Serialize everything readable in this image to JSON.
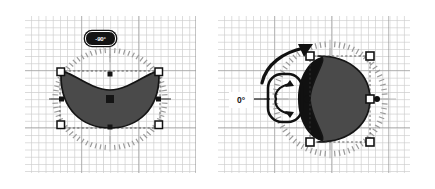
{
  "app": {
    "title": "Shape Rotation Tool",
    "view": "two-panel-comparison"
  },
  "panels": [
    {
      "id": "left",
      "name": "rotation-before-panel",
      "caption": "",
      "angle_label": "-90°",
      "angle_value": -90,
      "shape": {
        "name": "crescent-moon",
        "fill": "#4a4a4a",
        "stroke": "#141414",
        "orientation": "horizontal-concave-up"
      },
      "dial": {
        "visible": true,
        "tick_count": 72,
        "tick_color": "#9a9a9a",
        "cardinal_tick_color": "#b4b4b4"
      },
      "handles": {
        "corner_count": 4,
        "edge_count": 4,
        "center": 1,
        "corner_fill": "#ffffff",
        "corner_stroke": "#111111",
        "edge_fill": "#111111"
      },
      "rotation_arrow": {
        "visible": false
      },
      "rotation_cursor": {
        "visible": false
      }
    },
    {
      "id": "right",
      "name": "rotation-after-panel",
      "caption": "",
      "angle_label": "0°",
      "angle_value": 0,
      "shape": {
        "name": "crescent-moon",
        "fill": "#4a4a4a",
        "stroke": "#141414",
        "orientation": "vertical-concave-left"
      },
      "ghost": {
        "visible": true,
        "name": "rotation-ghost-shadow",
        "fill": "#111111"
      },
      "dial": {
        "visible": true,
        "tick_count": 72,
        "tick_color": "#9a9a9a",
        "cardinal_tick_color": "#b4b4b4"
      },
      "handles": {
        "corner_count": 4,
        "edge_count": 1,
        "center": 1,
        "corner_fill": "#ffffff",
        "corner_stroke": "#111111",
        "edge_fill": "#111111"
      },
      "rotation_arrow": {
        "visible": true,
        "name": "rotation-direction-arrow",
        "direction": "counter-clockwise-up-right",
        "color": "#111111"
      },
      "rotation_cursor": {
        "visible": true,
        "name": "rotation-cursor-widget",
        "glyph": "rotate-arrows",
        "color": "#111111"
      }
    }
  ],
  "colors": {
    "canvas_background": "#ffffff",
    "page_background": "#ffffff",
    "grid_minor": "#cdcdcd",
    "grid_major": "#969696",
    "shape_fill": "#4a4a4a",
    "shape_stroke": "#141414",
    "ghost_fill": "#111111",
    "handle_fill": "#ffffff",
    "handle_stroke": "#111111",
    "badge_background": "#141414",
    "badge_text": "#ffffff",
    "tick_color": "#9a9a9a"
  }
}
